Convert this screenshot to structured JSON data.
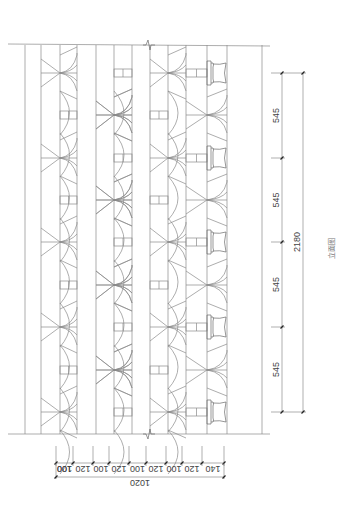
{
  "drawing": {
    "title": "立面图",
    "line_color": "#8a8a8a",
    "background": "#ffffff"
  },
  "panel": {
    "top_y": 45,
    "bottom_y": 434,
    "frame_lines_x": [
      25,
      41,
      60,
      77,
      96,
      114,
      132,
      150,
      168,
      186,
      207,
      227,
      262
    ],
    "module_rows_y": [
      73,
      115,
      158,
      200,
      242,
      285,
      327,
      370,
      412
    ],
    "break_symbol_x": 146
  },
  "dimensions": {
    "horizontal": {
      "segment_labels": [
        "140",
        "120",
        "100",
        "120",
        "100",
        "120",
        "100",
        "120",
        "100",
        "100"
      ],
      "tick_x": [
        224,
        202,
        182,
        166,
        146,
        129,
        109,
        93,
        73,
        56
      ],
      "total_label": "1020"
    },
    "vertical": {
      "segment_labels": [
        "545",
        "545",
        "545",
        "545"
      ],
      "tick_y": [
        73,
        158,
        242,
        327,
        412
      ],
      "total_label": "2180"
    }
  }
}
